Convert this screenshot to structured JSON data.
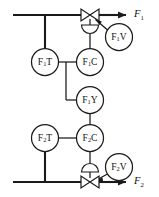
{
  "diagram": {
    "type": "process-instrumentation-diagram",
    "line_color": "#1a1a1a",
    "background_color": "#ffffff",
    "streams": [
      {
        "id": "stream-1",
        "label_main": "F",
        "label_sub": "1",
        "direction": "right"
      },
      {
        "id": "stream-2",
        "label_main": "F",
        "label_sub": "2",
        "direction": "right"
      }
    ],
    "instruments": [
      {
        "id": "f1t",
        "prefix": "F",
        "sub": "1",
        "suffix": "T",
        "cx": 45,
        "cy": 62,
        "r": 13.5
      },
      {
        "id": "f1c",
        "prefix": "F",
        "sub": "1",
        "suffix": "C",
        "cx": 90,
        "cy": 62,
        "r": 13.5
      },
      {
        "id": "f1v",
        "prefix": "F",
        "sub": "1",
        "suffix": "V",
        "cx": 119,
        "cy": 37,
        "r": 13.5
      },
      {
        "id": "f1y",
        "prefix": "F",
        "sub": "1",
        "suffix": "Y",
        "cx": 90,
        "cy": 100,
        "r": 13.5
      },
      {
        "id": "f2t",
        "prefix": "F",
        "sub": "2",
        "suffix": "T",
        "cx": 45,
        "cy": 138,
        "r": 13.5
      },
      {
        "id": "f2c",
        "prefix": "F",
        "sub": "2",
        "suffix": "C",
        "cx": 90,
        "cy": 138,
        "r": 13.5
      },
      {
        "id": "f2v",
        "prefix": "F",
        "sub": "2",
        "suffix": "V",
        "cx": 119,
        "cy": 167,
        "r": 13.5
      }
    ],
    "valves": [
      {
        "id": "valve-1",
        "cx": 90,
        "cy": 15,
        "actuator": "diaphragm",
        "actuator_cy": 29
      },
      {
        "id": "valve-2",
        "cx": 90,
        "cy": 182,
        "actuator": "diaphragm",
        "actuator_cy": 168
      }
    ],
    "stream_label_positions": [
      {
        "id": "label-f1",
        "x": 134,
        "y": 15
      },
      {
        "id": "label-f2",
        "x": 134,
        "y": 182
      }
    ]
  }
}
